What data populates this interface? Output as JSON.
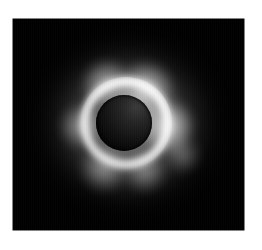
{
  "page": {
    "background_color": "#ffffff",
    "width": 262,
    "height": 250
  },
  "photo": {
    "subject": "total-solar-eclipse",
    "media_type": "grayscale photograph",
    "frame_color": "#000000",
    "frame_left": 13,
    "frame_top": 19,
    "frame_width": 231,
    "frame_height": 211,
    "alt_text": "Black-and-white photograph of a total solar eclipse showing a dark lunar disk surrounded by a bright white corona"
  },
  "eclipse": {
    "lunar_disk_label": "lunar-disk",
    "lunar_disk_center_x": 124,
    "lunar_disk_center_y": 123,
    "lunar_disk_radius": 28,
    "disk_color": "#0b0b0b",
    "corona_color": "#ffffff",
    "corona_label": "solar-corona",
    "corona_brightest_direction": "upper-right",
    "corona_outer_radius": 62
  },
  "caption": {
    "text": ""
  }
}
